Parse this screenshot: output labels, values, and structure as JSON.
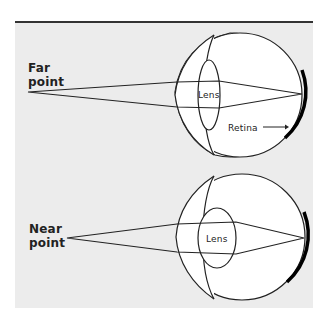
{
  "diagram": {
    "top_panel": {
      "point_label_line1": "Far",
      "point_label_line2": "point",
      "lens_label": "Lens",
      "retina_label": "Retina"
    },
    "bottom_panel": {
      "point_label_line1": "Near",
      "point_label_line2": "point",
      "lens_label": "Lens"
    },
    "colors": {
      "panel_bg": "#ececec",
      "eye_fill": "#ffffff",
      "stroke": "#222222"
    }
  }
}
